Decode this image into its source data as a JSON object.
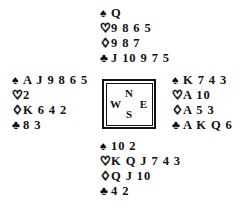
{
  "diagram": {
    "type": "bridge-hand-deal",
    "background_color": "#ffffff",
    "text_color": "#111111"
  },
  "suits": {
    "spade": {
      "symbol": "♠",
      "name": "spade",
      "fill": "solid"
    },
    "heart": {
      "symbol": "♡",
      "name": "heart",
      "fill": "outline"
    },
    "diamond": {
      "symbol": "♢",
      "name": "diamond",
      "fill": "outline"
    },
    "club": {
      "symbol": "♣",
      "name": "club",
      "fill": "solid"
    }
  },
  "compass": {
    "north": "N",
    "west": "W",
    "east": "E",
    "south": "S"
  },
  "hands": {
    "north": {
      "position": "North",
      "spades": "Q",
      "hearts": "9 8 6 5",
      "diamonds": "9 8 7",
      "clubs": "J 10 9 7 5"
    },
    "west": {
      "position": "West",
      "spades": "A J 9 8 6 5",
      "hearts": "2",
      "diamonds": "K 6 4 2",
      "clubs": "8 3"
    },
    "east": {
      "position": "East",
      "spades": "K 7 4 3",
      "hearts": "A 10",
      "diamonds": "A 5 3",
      "clubs": "A K Q 6"
    },
    "south": {
      "position": "South",
      "spades": "10 2",
      "hearts": "K Q J 7 4 3",
      "diamonds": "Q J 10",
      "clubs": "4 2"
    }
  }
}
